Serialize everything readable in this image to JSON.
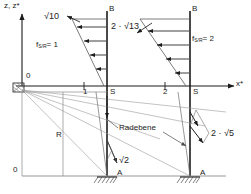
{
  "figure": {
    "type": "force-distribution-diagram",
    "width": 251,
    "height": 194,
    "colors": {
      "line": "#1c1c1c",
      "thin": "#6f6f6f",
      "background": "#ffffff"
    }
  },
  "axes": {
    "vertical_label": "z, z*",
    "horizontal_label": "x*",
    "origin_top_label": "0",
    "origin_bottom_label": "0"
  },
  "members": {
    "left": {
      "top_node": "B",
      "bottom_node": "A",
      "base_label": "S",
      "station_label": "1",
      "load_label": "f",
      "load_sub": "S/R",
      "load_value": "= 1",
      "resultant": "√10",
      "diagonal": "√2"
    },
    "right": {
      "top_node": "B",
      "bottom_node": "A",
      "base_label": "S",
      "station_label": "2",
      "load_label": "f",
      "load_sub": "S/R",
      "load_value": "= 2",
      "resultant": "2 · √13",
      "diagonal": "2 · √5"
    }
  },
  "annotations": {
    "radebene": "Radebene",
    "radius_label": "R"
  }
}
